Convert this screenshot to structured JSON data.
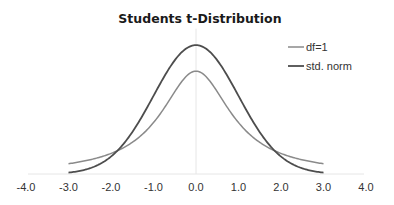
{
  "chart_data": {
    "type": "line",
    "title": "Students t-Distribution",
    "xlabel": "",
    "ylabel": "",
    "xlim": [
      -4.0,
      4.0
    ],
    "ylim": [
      0,
      0.45
    ],
    "x_ticks": [
      "-4.0",
      "-3.0",
      "-2.0",
      "-1.0",
      "0.0",
      "1.0",
      "2.0",
      "3.0",
      "4.0"
    ],
    "x_tick_values": [
      -4,
      -3,
      -2,
      -1,
      0,
      1,
      2,
      3,
      4
    ],
    "grid": false,
    "legend_position": "top-right",
    "x": [
      -3.0,
      -2.5,
      -2.0,
      -1.5,
      -1.0,
      -0.5,
      0.0,
      0.5,
      1.0,
      1.5,
      2.0,
      2.5,
      3.0
    ],
    "series": [
      {
        "name": "df=1",
        "color": "#8a8a8a",
        "values": [
          0.0318,
          0.0439,
          0.0637,
          0.0979,
          0.1592,
          0.2546,
          0.3183,
          0.2546,
          0.1592,
          0.0979,
          0.0637,
          0.0439,
          0.0318
        ]
      },
      {
        "name": "std. norm",
        "color": "#4d4d4d",
        "values": [
          0.0044,
          0.0175,
          0.054,
          0.1295,
          0.242,
          0.3521,
          0.3989,
          0.3521,
          0.242,
          0.1295,
          0.054,
          0.0175,
          0.0044
        ]
      }
    ],
    "curve_formulas": {
      "df=1": "t-distribution pdf with 1 degree of freedom",
      "std. norm": "standard normal pdf"
    }
  }
}
